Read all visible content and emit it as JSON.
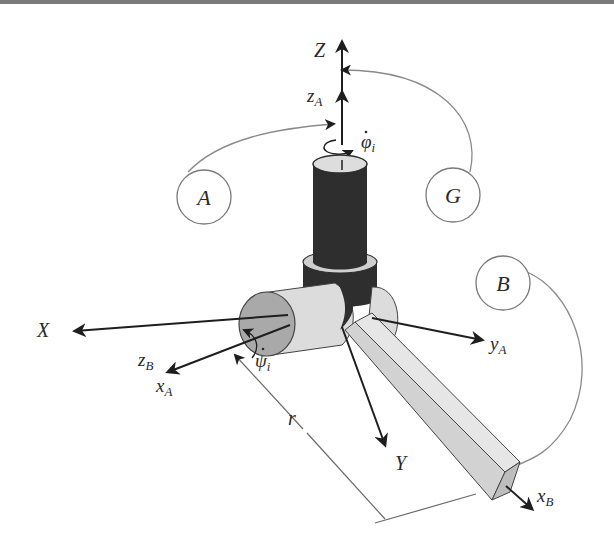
{
  "diagram": {
    "type": "coordinate-frame-diagram",
    "axes": {
      "Z": "Z",
      "X": "X",
      "Y": "Y",
      "zA": {
        "base": "z",
        "sub": "A"
      },
      "xA": {
        "base": "x",
        "sub": "A"
      },
      "yA": {
        "base": "y",
        "sub": "A"
      },
      "zB": {
        "base": "z",
        "sub": "B"
      },
      "xB": {
        "base": "x",
        "sub": "B"
      }
    },
    "rates": {
      "phi": {
        "base": "φ",
        "sub": "i",
        "dot": "·"
      },
      "psi": {
        "base": "ψ",
        "sub": "i",
        "dot": "·"
      }
    },
    "callouts": {
      "A": "A",
      "G": "G",
      "B": "B"
    },
    "dimension": {
      "r": "r"
    },
    "colors": {
      "post_dark": "#2e2e2e",
      "joint_light": "#dcdcdc",
      "joint_face": "#a9a9a9",
      "arm_light": "#d6d6d6",
      "arm_top": "#e6e6e6",
      "line": "#1e1e1e",
      "callout_line": "#8a8a8a"
    }
  }
}
